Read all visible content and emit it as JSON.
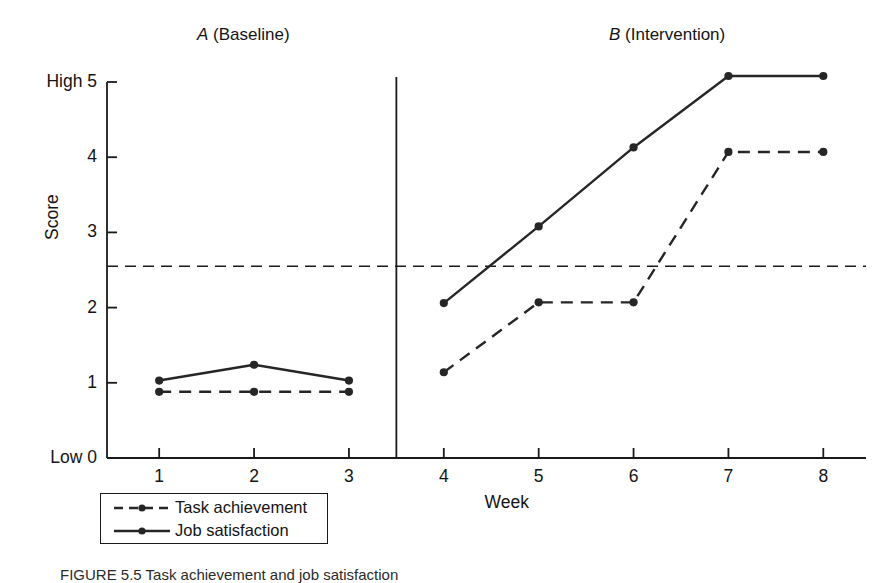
{
  "figure": {
    "caption": "FIGURE 5.5 Task achievement and job satisfaction",
    "phase_a_letter": "A",
    "phase_a_name": " (Baseline)",
    "phase_b_letter": "B",
    "phase_b_name": " (Intervention)"
  },
  "chart_data": {
    "type": "line",
    "title": "",
    "xlabel": "Week",
    "ylabel": "Score",
    "x": [
      1,
      2,
      3,
      4,
      5,
      6,
      7,
      8
    ],
    "xtick_labels": [
      "1",
      "2",
      "3",
      "4",
      "5",
      "6",
      "7",
      "8"
    ],
    "ytick_values": [
      0,
      1,
      2,
      3,
      4,
      5
    ],
    "ytick_labels": [
      "Low 0",
      "1",
      "2",
      "3",
      "4",
      "High 5"
    ],
    "xlim": [
      0.45,
      8.45
    ],
    "ylim": [
      0,
      5
    ],
    "grid": false,
    "legend_position": "below-left",
    "series": [
      {
        "name": "Task achievement",
        "style": "dashed",
        "marker": "filled-circle",
        "color": "#262626",
        "x": [
          1,
          2,
          3,
          4,
          5,
          6,
          7,
          8
        ],
        "values": [
          0.88,
          0.88,
          0.88,
          1.14,
          2.07,
          2.07,
          4.07,
          4.07
        ]
      },
      {
        "name": "Job satisfaction",
        "style": "solid",
        "marker": "filled-circle",
        "color": "#262626",
        "x": [
          1,
          2,
          3,
          4,
          5,
          6,
          7,
          8
        ],
        "values": [
          1.03,
          1.24,
          1.03,
          2.06,
          3.08,
          4.13,
          5.08,
          5.08
        ]
      }
    ],
    "annotations": [
      {
        "name": "phase-divider",
        "type": "vline",
        "x": 3.5,
        "style": "solid",
        "label_a": "A (Baseline)",
        "label_b": "B (Intervention)"
      },
      {
        "name": "criterion-reference-line",
        "type": "hline",
        "y": 2.55,
        "style": "dashed"
      }
    ]
  },
  "legend": {
    "items": [
      {
        "label": "Task achievement",
        "style": "dashed"
      },
      {
        "label": "Job satisfaction",
        "style": "solid"
      }
    ]
  }
}
